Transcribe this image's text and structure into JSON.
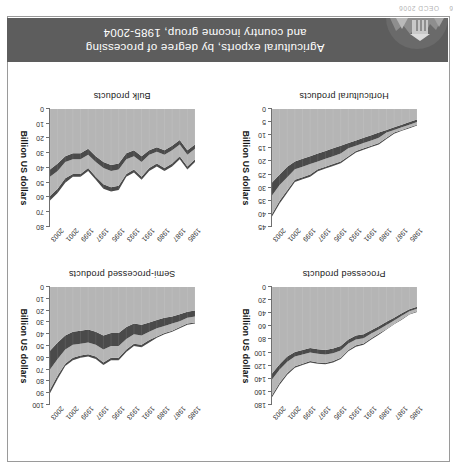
{
  "page": {
    "footer_number": "6",
    "footer_text": "OECD 2006"
  },
  "figure": {
    "title_line1": "Agricultural exports, by degree of processing",
    "title_line2": "and country income group, 1985-2004",
    "badge_name": "oecd-landscape-badge"
  },
  "legend": {
    "items": [
      {
        "label": "OECD",
        "color": "#b5b5b5"
      },
      {
        "label": "Lower middle income",
        "color": "#b5b5b5"
      },
      {
        "label": "Upper middle income",
        "color": "#4a4a4a"
      },
      {
        "label": "Low income",
        "color": "#4a4a4a"
      }
    ]
  },
  "colors": {
    "band_light": "#b5b5b5",
    "band_dark": "#4a4a4a",
    "axis": "#6f6f6f",
    "title_bar": "#5d5d5d",
    "frame": "#9a9a9a"
  },
  "chart_data": [
    {
      "id": "processed",
      "type": "area",
      "title": "Processed products",
      "xlabel": "",
      "ylabel": "Billion US dollars",
      "grid": false,
      "legend_position": "top",
      "x": [
        1985,
        1986,
        1987,
        1988,
        1989,
        1990,
        1991,
        1992,
        1993,
        1994,
        1995,
        1996,
        1997,
        1998,
        1999,
        2000,
        2001,
        2002,
        2003,
        2004
      ],
      "xticks": [
        1985,
        1987,
        1989,
        1991,
        1993,
        1995,
        1997,
        1999,
        2001,
        2003
      ],
      "ylim": [
        0,
        180
      ],
      "yticks": [
        0,
        20,
        40,
        60,
        80,
        100,
        120,
        140,
        160,
        180
      ],
      "series": [
        {
          "name": "OECD",
          "color": "#b5b5b5",
          "values": [
            30,
            34,
            40,
            47,
            53,
            60,
            66,
            72,
            74,
            80,
            90,
            94,
            96,
            95,
            93,
            96,
            99,
            106,
            118,
            132
          ]
        },
        {
          "name": "Upper middle income",
          "color": "#4a4a4a",
          "values": [
            3,
            3,
            4,
            4,
            5,
            5,
            5,
            6,
            6,
            6,
            7,
            7,
            7,
            7,
            7,
            7,
            7,
            8,
            8,
            9
          ]
        },
        {
          "name": "Lower middle income",
          "color": "#b5b5b5",
          "values": [
            4,
            4,
            5,
            5,
            6,
            6,
            7,
            8,
            9,
            10,
            11,
            12,
            13,
            13,
            13,
            14,
            15,
            17,
            20,
            24
          ]
        },
        {
          "name": "Low income",
          "color": "#4a4a4a",
          "values": [
            1,
            1,
            1,
            1,
            1,
            2,
            2,
            2,
            2,
            2,
            2,
            2,
            2,
            2,
            2,
            2,
            2,
            3,
            3,
            3
          ]
        }
      ]
    },
    {
      "id": "semi-processed",
      "type": "area",
      "title": "Semi-processed products",
      "xlabel": "",
      "ylabel": "Billion US dollars",
      "grid": false,
      "legend_position": "top",
      "x": [
        1985,
        1986,
        1987,
        1988,
        1989,
        1990,
        1991,
        1992,
        1993,
        1994,
        1995,
        1996,
        1997,
        1998,
        1999,
        2000,
        2001,
        2002,
        2003,
        2004
      ],
      "xticks": [
        1985,
        1987,
        1989,
        1991,
        1993,
        1995,
        1997,
        1999,
        2001,
        2003
      ],
      "ylim": [
        0,
        100
      ],
      "yticks": [
        0,
        10,
        20,
        30,
        40,
        50,
        60,
        70,
        80,
        90,
        100
      ],
      "series": [
        {
          "name": "OECD",
          "color": "#b5b5b5",
          "values": [
            20,
            21,
            23,
            25,
            26,
            28,
            30,
            32,
            31,
            34,
            39,
            39,
            41,
            38,
            36,
            37,
            38,
            41,
            47,
            54
          ]
        },
        {
          "name": "Upper middle income",
          "color": "#4a4a4a",
          "values": [
            5,
            5,
            6,
            6,
            7,
            7,
            8,
            9,
            9,
            10,
            11,
            11,
            12,
            11,
            11,
            11,
            11,
            12,
            14,
            16
          ]
        },
        {
          "name": "Lower middle income",
          "color": "#b5b5b5",
          "values": [
            5,
            5,
            5,
            6,
            6,
            7,
            7,
            8,
            8,
            9,
            10,
            10,
            11,
            10,
            10,
            10,
            11,
            12,
            14,
            17
          ]
        },
        {
          "name": "Low income",
          "color": "#4a4a4a",
          "values": [
            1,
            1,
            1,
            1,
            1,
            1,
            2,
            2,
            2,
            2,
            2,
            2,
            2,
            2,
            2,
            2,
            2,
            2,
            3,
            3
          ]
        }
      ]
    },
    {
      "id": "horticultural",
      "type": "area",
      "title": "Horticultural products",
      "xlabel": "",
      "ylabel": "Billion US dollars",
      "grid": false,
      "legend_position": "top",
      "x": [
        1985,
        1986,
        1987,
        1988,
        1989,
        1990,
        1991,
        1992,
        1993,
        1994,
        1995,
        1996,
        1997,
        1998,
        1999,
        2000,
        2001,
        2002,
        2003,
        2004
      ],
      "xticks": [
        1985,
        1987,
        1989,
        1991,
        1993,
        1995,
        1997,
        1999,
        2001,
        2003
      ],
      "ylim": [
        0,
        45
      ],
      "yticks": [
        0,
        5,
        10,
        15,
        20,
        25,
        30,
        35,
        40,
        45
      ],
      "series": [
        {
          "name": "OECD",
          "color": "#b5b5b5",
          "values": [
            4,
            5,
            6,
            7,
            8,
            9,
            10,
            11,
            12,
            13,
            14,
            15,
            16,
            17,
            18,
            19,
            20,
            22,
            25,
            28
          ]
        },
        {
          "name": "Upper middle income",
          "color": "#4a4a4a",
          "values": [
            1,
            1,
            1,
            1,
            1,
            2,
            2,
            2,
            2,
            2,
            3,
            3,
            3,
            3,
            3,
            3,
            3,
            4,
            4,
            5
          ]
        },
        {
          "name": "Lower middle income",
          "color": "#b5b5b5",
          "values": [
            1,
            1,
            1,
            1,
            2,
            2,
            2,
            2,
            2,
            3,
            3,
            3,
            3,
            3,
            4,
            4,
            4,
            5,
            6,
            7
          ]
        },
        {
          "name": "Low income",
          "color": "#4a4a4a",
          "values": [
            0.3,
            0.3,
            0.3,
            0.4,
            0.4,
            0.5,
            0.5,
            0.5,
            0.6,
            0.6,
            0.7,
            0.7,
            0.7,
            0.7,
            0.8,
            0.8,
            0.8,
            0.9,
            1,
            1
          ]
        }
      ]
    },
    {
      "id": "bulk",
      "type": "area",
      "title": "Bulk products",
      "xlabel": "",
      "ylabel": "Billion US dollars",
      "grid": false,
      "legend_position": "top",
      "x": [
        1985,
        1986,
        1987,
        1988,
        1989,
        1990,
        1991,
        1992,
        1993,
        1994,
        1995,
        1996,
        1997,
        1998,
        1999,
        2000,
        2001,
        2002,
        2003,
        2004
      ],
      "xticks": [
        1985,
        1987,
        1989,
        1991,
        1993,
        1995,
        1997,
        1999,
        2001,
        2003
      ],
      "ylim": [
        0,
        80
      ],
      "yticks": [
        0,
        10,
        20,
        30,
        40,
        50,
        60,
        70,
        80
      ],
      "series": [
        {
          "name": "OECD",
          "color": "#b5b5b5",
          "values": [
            24,
            28,
            21,
            25,
            28,
            26,
            28,
            32,
            28,
            30,
            37,
            38,
            36,
            32,
            27,
            30,
            30,
            32,
            37,
            41
          ]
        },
        {
          "name": "Upper middle income",
          "color": "#4a4a4a",
          "values": [
            3,
            3,
            3,
            3,
            3,
            3,
            3,
            4,
            4,
            4,
            4,
            4,
            4,
            4,
            4,
            4,
            4,
            4,
            5,
            5
          ]
        },
        {
          "name": "Lower middle income",
          "color": "#b5b5b5",
          "values": [
            7,
            8,
            8,
            9,
            9,
            8,
            9,
            10,
            9,
            10,
            11,
            11,
            11,
            10,
            9,
            10,
            10,
            11,
            12,
            13
          ]
        },
        {
          "name": "Low income",
          "color": "#4a4a4a",
          "values": [
            2,
            2,
            2,
            2,
            2,
            2,
            2,
            2,
            2,
            2,
            3,
            3,
            3,
            2,
            2,
            2,
            2,
            3,
            3,
            3
          ]
        }
      ]
    }
  ]
}
